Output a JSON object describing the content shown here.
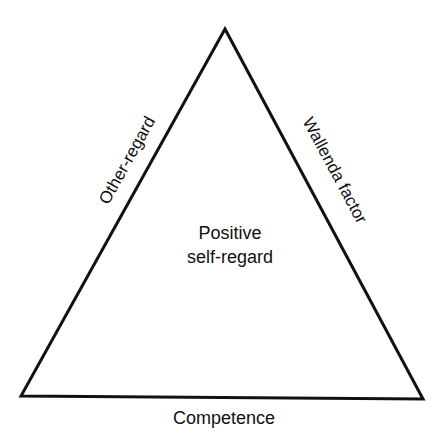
{
  "diagram": {
    "type": "triangle",
    "center_label": {
      "line1": "Positive",
      "line2": "self-regard"
    },
    "edges": {
      "left": "Other-regard",
      "right": "Wallenda factor",
      "bottom": "Competence"
    },
    "colors": {
      "stroke": "#111111",
      "background": "#ffffff",
      "text": "#111111"
    }
  }
}
